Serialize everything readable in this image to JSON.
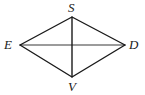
{
  "figure": {
    "kind": "geometry-diagram",
    "shape_name": "quadrilateral-ESDV",
    "canvas": {
      "width": 145,
      "height": 95,
      "background": "#ffffff"
    },
    "style": {
      "edge_color": "#1a1a1a",
      "edge_width": 1.4,
      "vertical_diagonal_color": "#1a1a1a",
      "vertical_diagonal_width": 1.4,
      "horizontal_diagonal_color": "#7a7a7a",
      "horizontal_diagonal_width": 1.3,
      "label_color": "#1a1a1a"
    },
    "vertices": [
      {
        "id": "S",
        "label": "S",
        "x": 72,
        "y": 17,
        "position": "top"
      },
      {
        "id": "E",
        "label": "E",
        "x": 20,
        "y": 45,
        "position": "left"
      },
      {
        "id": "D",
        "label": "D",
        "x": 125,
        "y": 45,
        "position": "right"
      },
      {
        "id": "V",
        "label": "V",
        "x": 72,
        "y": 77,
        "position": "bottom"
      }
    ],
    "edges": [
      {
        "id": "ES",
        "from": "E",
        "to": "S"
      },
      {
        "id": "SD",
        "from": "S",
        "to": "D"
      },
      {
        "id": "DV",
        "from": "D",
        "to": "V"
      },
      {
        "id": "VE",
        "from": "V",
        "to": "E"
      }
    ],
    "diagonals": [
      {
        "id": "SV",
        "from": "S",
        "to": "V",
        "orientation": "vertical"
      },
      {
        "id": "ED",
        "from": "E",
        "to": "D",
        "orientation": "horizontal"
      }
    ],
    "intersection": {
      "id": "center",
      "x": 72,
      "y": 45
    }
  },
  "labels": {
    "S": "S",
    "E": "E",
    "D": "D",
    "V": "V"
  }
}
